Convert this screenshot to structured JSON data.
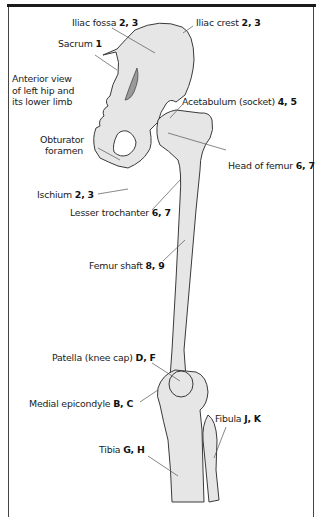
{
  "figure": {
    "title_partial": "",
    "caption": {
      "lines": [
        "Anterior view",
        "of left hip and",
        "its lower limb"
      ]
    },
    "colors": {
      "bone_fill": "#e6e6e6",
      "bone_outline": "#3a3a3a",
      "shadow": "#9a9a9a",
      "leader_line": "#555555",
      "frame": "#444444",
      "top_rule": "#1a1a1a"
    },
    "labels": {
      "iliac_fossa": {
        "name": "Iliac fossa",
        "refs": "2, 3"
      },
      "iliac_crest": {
        "name": "Iliac crest",
        "refs": "2, 3"
      },
      "sacrum": {
        "name": "Sacrum",
        "refs": "1"
      },
      "acetabulum": {
        "name": "Acetabulum (socket)",
        "refs": "4, 5"
      },
      "obturator_foramen": {
        "name_line1": "Obturator",
        "name_line2": "foramen"
      },
      "head_of_femur": {
        "name": "Head of femur",
        "refs": "6, 7"
      },
      "ischium": {
        "name": "Ischium",
        "refs": "2, 3"
      },
      "lesser_trochanter": {
        "name": "Lesser trochanter",
        "refs": "6, 7"
      },
      "femur_shaft": {
        "name": "Femur shaft",
        "refs": "8, 9"
      },
      "patella": {
        "name": "Patella (knee cap)",
        "refs": "D, F"
      },
      "medial_epicondyle": {
        "name": "Medial epicondyle",
        "refs": "B, C"
      },
      "fibula": {
        "name": "Fibula",
        "refs": "J, K"
      },
      "tibia": {
        "name": "Tibia",
        "refs": "G, H"
      }
    }
  }
}
